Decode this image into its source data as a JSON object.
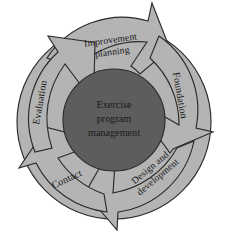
{
  "diagram": {
    "type": "cyclical-process",
    "title": "Exercise program management",
    "hub": {
      "label_lines": [
        "Exercise",
        "program",
        "management"
      ],
      "fill_color": "#5d5d5d"
    },
    "ring": {
      "fill_color": "#b4b4b4",
      "outline_color": "#2b2b2b",
      "direction": "clockwise",
      "segment_count": 5
    },
    "background_color": "#ffffff",
    "stages": [
      {
        "id": "improvement-planning",
        "order": 1,
        "position": "top",
        "lines": [
          "Improvement",
          "planning"
        ],
        "rotation_deg": -8
      },
      {
        "id": "foundation",
        "order": 2,
        "position": "right",
        "lines": [
          "Foundation"
        ],
        "rotation_deg": 80
      },
      {
        "id": "design-and-development",
        "order": 3,
        "position": "bottom-right",
        "lines": [
          "Design and",
          "development"
        ],
        "rotation_deg": 140
      },
      {
        "id": "contact",
        "order": 4,
        "position": "bottom-left",
        "lines": [
          "Contact"
        ],
        "rotation_deg": -25
      },
      {
        "id": "evaluation",
        "order": 5,
        "position": "left",
        "lines": [
          "Evaluation"
        ],
        "rotation_deg": -80
      }
    ]
  }
}
